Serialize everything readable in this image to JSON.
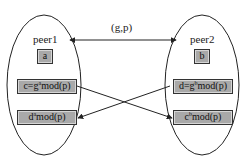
{
  "diagram": {
    "type": "key-exchange",
    "public_params_label": "(g,p)",
    "peers": [
      {
        "name": "peer1",
        "secret": "a",
        "public_value": {
          "lhs": "c=g",
          "exp": "a",
          "rhs": "mod(p)"
        },
        "shared_key": {
          "base": "d",
          "exp": "a",
          "rhs": "mod(p)"
        }
      },
      {
        "name": "peer2",
        "secret": "b",
        "public_value": {
          "lhs": "d=g",
          "exp": "b",
          "rhs": "mod(p)"
        },
        "shared_key": {
          "base": "c",
          "exp": "b",
          "rhs": "mod(p)"
        }
      }
    ],
    "edges": [
      {
        "from": "peer1",
        "to": "peer2",
        "label": "(g,p)",
        "direction": "both"
      },
      {
        "from": "peer1.public_value",
        "to": "peer2.shared_key"
      },
      {
        "from": "peer2.public_value",
        "to": "peer1.shared_key"
      }
    ],
    "colors": {
      "box_fill": "#a9a9a9",
      "stroke": "#333333",
      "background": "#ffffff"
    }
  }
}
